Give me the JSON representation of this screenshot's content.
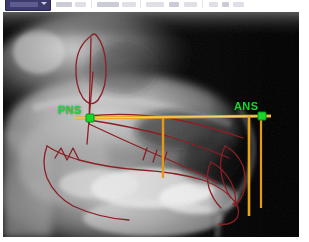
{
  "app": {
    "title": "Cephalometric Tracing",
    "background_color": "#ffffff"
  },
  "toolbar": {
    "active_tool_label": "",
    "items": [
      {
        "name": "tool-select",
        "label": ""
      },
      {
        "name": "tool-measure",
        "label": ""
      },
      {
        "name": "tool-trace",
        "label": ""
      },
      {
        "name": "tool-landmark",
        "label": ""
      },
      {
        "name": "tool-zoom",
        "label": ""
      },
      {
        "name": "tool-contrast",
        "label": ""
      },
      {
        "name": "tool-export",
        "label": ""
      }
    ]
  },
  "radiograph": {
    "modality_label": "Lateral Cephalogram",
    "background_color": "#000000"
  },
  "overlay": {
    "colors": {
      "tracing": "#8c1f24",
      "plane": "#e8a41c",
      "plane_highlight": "#f5d76a",
      "landmark": "#14d82a",
      "vertical": "#e39a18"
    },
    "landmarks": [
      {
        "id": "pns",
        "label": "PNS",
        "full_name": "Posterior Nasal Spine",
        "x": 87,
        "y": 106,
        "color": "#14d82a"
      },
      {
        "id": "ans",
        "label": "ANS",
        "full_name": "Anterior Nasal Spine",
        "x": 259,
        "y": 104,
        "color": "#14d82a"
      }
    ],
    "planes": [
      {
        "id": "palatal-plane",
        "label": "",
        "from": "pns",
        "to": "ans",
        "color": "#e8a41c"
      }
    ],
    "verticals": [
      {
        "id": "vertical-molar",
        "x": 160,
        "y_top": 108,
        "y_bottom": 166,
        "color": "#e39a18"
      },
      {
        "id": "vertical-incisor",
        "x": 246,
        "y_top": 104,
        "y_bottom": 204,
        "color": "#e39a18"
      },
      {
        "id": "vertical-ans-drop",
        "x": 259,
        "y_top": 104,
        "y_bottom": 196,
        "color": "#e39a18"
      }
    ]
  }
}
